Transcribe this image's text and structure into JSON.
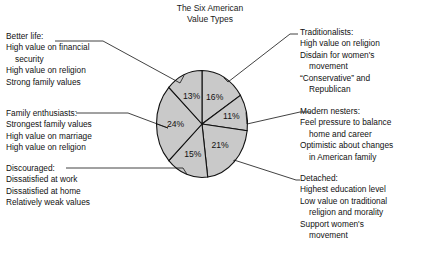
{
  "chart_data": {
    "type": "pie",
    "title": "The Six American\nValue Types",
    "xlabel": "",
    "ylabel": "",
    "legend_position": "callout-annotations",
    "grid": false,
    "slice_fill_color": "#c9c9c9",
    "slice_stroke_color": "#111111",
    "start_angle_deg": 0,
    "direction": "clockwise",
    "categories": [
      "Traditionalists",
      "Modern nesters",
      "Detached",
      "Discouraged",
      "Family enthusiasts",
      "Better life"
    ],
    "values": [
      16,
      11,
      21,
      15,
      24,
      13
    ],
    "value_labels": [
      "16%",
      "11%",
      "21%",
      "15%",
      "24%",
      "13%"
    ],
    "annotations": [
      {
        "key": "better_life",
        "heading": "Better life:",
        "lines": [
          {
            "text": "High value on financial",
            "indent": false
          },
          {
            "text": "security",
            "indent": true
          },
          {
            "text": "High value on religion",
            "indent": false
          },
          {
            "text": "Strong family values",
            "indent": false
          }
        ],
        "value": "13%"
      },
      {
        "key": "family_enthusiasts",
        "heading": "Family enthusiasts:",
        "lines": [
          {
            "text": "Strongest family values",
            "indent": false
          },
          {
            "text": "High value on marriage",
            "indent": false
          },
          {
            "text": "High value on religion",
            "indent": false
          }
        ],
        "value": "24%"
      },
      {
        "key": "discouraged",
        "heading": "Discouraged:",
        "lines": [
          {
            "text": "Dissatisfied at work",
            "indent": false
          },
          {
            "text": "Dissatisfied at home",
            "indent": false
          },
          {
            "text": "Relatively weak values",
            "indent": false
          }
        ],
        "value": "15%"
      },
      {
        "key": "traditionalists",
        "heading": "Traditionalists:",
        "lines": [
          {
            "text": "High value on religion",
            "indent": false
          },
          {
            "text": "Disdain for women's",
            "indent": false
          },
          {
            "text": "movement",
            "indent": true
          },
          {
            "text": "“Conservative” and",
            "indent": false
          },
          {
            "text": "Republican",
            "indent": true
          }
        ],
        "value": "16%"
      },
      {
        "key": "modern_nesters",
        "heading": "Modern nesters:",
        "lines": [
          {
            "text": "Feel pressure to balance",
            "indent": false
          },
          {
            "text": "home and career",
            "indent": true
          },
          {
            "text": "Optimistic about changes",
            "indent": false
          },
          {
            "text": "in American family",
            "indent": true
          }
        ],
        "value": "11%"
      },
      {
        "key": "detached",
        "heading": "Detached:",
        "lines": [
          {
            "text": "Highest education level",
            "indent": false
          },
          {
            "text": "Low value on traditional",
            "indent": false
          },
          {
            "text": "religion and morality",
            "indent": true
          },
          {
            "text": "Support women's",
            "indent": false
          },
          {
            "text": "movement",
            "indent": true
          }
        ],
        "value": "21%"
      }
    ]
  },
  "title_text": "The Six American\nValue Types"
}
